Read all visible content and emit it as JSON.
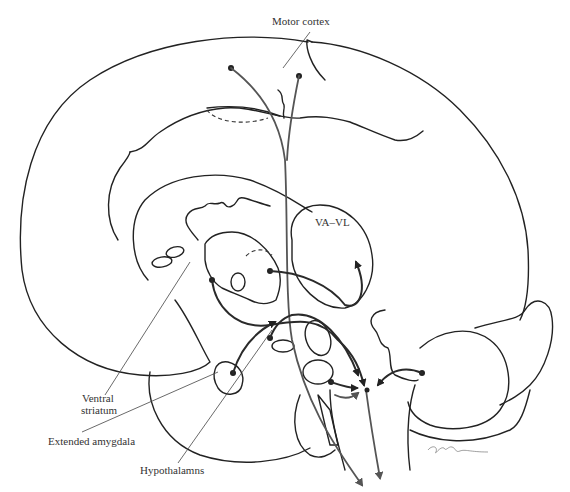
{
  "figure": {
    "type": "anatomical line drawing (sagittal brain section)",
    "labels": {
      "motor_cortex": "Motor cortex",
      "va_vl": "VA–VL",
      "ventral_striatum_line1": "Ventral",
      "ventral_striatum_line2": "striatum",
      "extended_amygdala": "Extended amygdala",
      "hypothalamus": "Hypothalamns"
    },
    "signature": "artist signature (scribble)",
    "colors": {
      "stroke": "#222222",
      "background": "#ffffff"
    }
  }
}
